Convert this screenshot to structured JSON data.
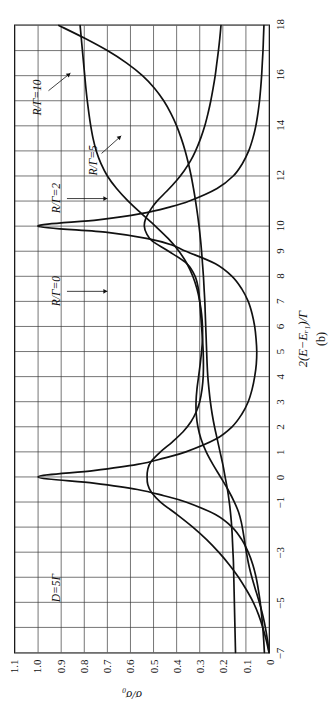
{
  "chart_data": {
    "type": "line",
    "title": "",
    "subtitle": "",
    "panel_caption": "(b)",
    "xlabel": "2(E−Eᵣ₁)/Γ",
    "ylabel": "σ/σ₀",
    "xlim": [
      -7,
      18
    ],
    "ylim": [
      0,
      1.1
    ],
    "grid": true,
    "legend_position": "in-plot-annotations",
    "xticks": [
      -7,
      -5,
      -3,
      -1,
      0,
      1,
      2,
      3,
      4,
      5,
      6,
      7,
      8,
      9,
      10,
      12,
      14,
      16,
      18
    ],
    "xticklabels": [
      "−7",
      "−5",
      "−3",
      "−1",
      "0",
      "1",
      "2",
      "3",
      "4",
      "5",
      "6",
      "7",
      "8",
      "9",
      "10",
      "12",
      "14",
      "16",
      "18"
    ],
    "xgridlines": [
      -7,
      -6,
      -5,
      -4,
      -3,
      -2,
      -1,
      0,
      1,
      2,
      3,
      4,
      5,
      6,
      7,
      8,
      9,
      10,
      11,
      12,
      13,
      14,
      15,
      16,
      17,
      18
    ],
    "yticks": [
      0,
      0.1,
      0.2,
      0.3,
      0.4,
      0.5,
      0.6,
      0.7,
      0.8,
      0.9,
      1.0,
      1.1
    ],
    "yticklabels": [
      "0",
      "0.1",
      "0.2",
      "0.3",
      "0.4",
      "0.5",
      "0.6",
      "0.7",
      "0.8",
      "0.9",
      "1.0",
      "1.1"
    ],
    "annotations": [
      {
        "name": "parameter-note",
        "text": "D=5Γ",
        "x": -4.4,
        "y": 0.92
      },
      {
        "name": "curve-label-r0",
        "text": "R/Γ=0",
        "x": 7.4,
        "y": 0.92
      },
      {
        "name": "curve-label-r2",
        "text": "R/Γ=2",
        "x": 11.1,
        "y": 0.92
      },
      {
        "name": "curve-label-r5",
        "text": "R/Γ=5",
        "x": 12.6,
        "y": 0.76
      },
      {
        "name": "curve-label-r10",
        "text": "R/Γ=10",
        "x": 15.1,
        "y": 1.0
      }
    ],
    "series": [
      {
        "name": "R/Γ=0",
        "label": "R/Γ=0",
        "color": "#111111",
        "x": [
          -7,
          -6.5,
          -6,
          -5.5,
          -5,
          -4.5,
          -4,
          -3.5,
          -3,
          -2.5,
          -2,
          -1.5,
          -1,
          -0.75,
          -0.5,
          -0.25,
          0,
          0.25,
          0.5,
          0.75,
          1,
          1.5,
          2,
          2.5,
          3,
          3.5,
          4,
          4.5,
          5,
          5.5,
          6,
          6.5,
          7,
          7.5,
          8,
          8.5,
          9,
          9.25,
          9.5,
          9.75,
          10,
          10.25,
          10.5,
          10.75,
          11,
          11.5,
          12,
          12.5,
          13,
          13.5,
          14,
          14.5,
          15,
          15.5,
          16,
          16.5,
          17,
          17.5,
          18
        ],
        "y": [
          0.02,
          0.023,
          0.027,
          0.032,
          0.038,
          0.046,
          0.056,
          0.07,
          0.09,
          0.118,
          0.16,
          0.232,
          0.36,
          0.455,
          0.57,
          0.76,
          1.0,
          0.76,
          0.57,
          0.455,
          0.36,
          0.232,
          0.16,
          0.118,
          0.09,
          0.073,
          0.062,
          0.055,
          0.053,
          0.056,
          0.062,
          0.073,
          0.09,
          0.118,
          0.16,
          0.232,
          0.36,
          0.42,
          0.525,
          0.7,
          1.0,
          0.74,
          0.555,
          0.435,
          0.345,
          0.225,
          0.155,
          0.115,
          0.088,
          0.07,
          0.057,
          0.048,
          0.041,
          0.036,
          0.032,
          0.029,
          0.026,
          0.024,
          0.022
        ]
      },
      {
        "name": "R/Γ=2",
        "label": "R/Γ=2",
        "color": "#111111",
        "x": [
          -7,
          -6.5,
          -6,
          -5.5,
          -5,
          -4.5,
          -4,
          -3.5,
          -3,
          -2.5,
          -2,
          -1.5,
          -1,
          -0.6,
          -0.3,
          0,
          0.3,
          0.6,
          1,
          1.4,
          1.8,
          2.2,
          2.6,
          3,
          3.5,
          4,
          4.5,
          5,
          5.5,
          6,
          6.5,
          7,
          7.5,
          8,
          8.5,
          9,
          9.4,
          9.7,
          10,
          10.3,
          10.7,
          11,
          11.4,
          11.8,
          12.2,
          12.6,
          13,
          13.5,
          14,
          14.5,
          15,
          15.5,
          16,
          16.5,
          17,
          17.5,
          18
        ],
        "y": [
          0.0,
          0.012,
          0.027,
          0.045,
          0.068,
          0.098,
          0.132,
          0.172,
          0.218,
          0.27,
          0.33,
          0.398,
          0.47,
          0.51,
          0.525,
          0.528,
          0.525,
          0.512,
          0.47,
          0.418,
          0.372,
          0.338,
          0.315,
          0.3,
          0.29,
          0.285,
          0.284,
          0.285,
          0.288,
          0.292,
          0.296,
          0.3,
          0.306,
          0.32,
          0.355,
          0.435,
          0.505,
          0.53,
          0.54,
          0.534,
          0.51,
          0.485,
          0.442,
          0.402,
          0.368,
          0.34,
          0.318,
          0.296,
          0.278,
          0.264,
          0.252,
          0.242,
          0.233,
          0.226,
          0.219,
          0.213,
          0.208
        ]
      },
      {
        "name": "R/Γ=5",
        "label": "R/Γ=5",
        "color": "#111111",
        "x": [
          -7,
          -6.6,
          -6.2,
          -5.8,
          -5.4,
          -5,
          -4.6,
          -4.2,
          -3.8,
          -3.4,
          -3,
          -2.6,
          -2.2,
          -1.8,
          -1.4,
          -1,
          -0.5,
          0,
          0.5,
          1,
          1.5,
          2,
          2.5,
          3,
          3.5,
          4,
          4.5,
          5,
          5.5,
          6,
          6.5,
          7,
          7.5,
          8,
          8.5,
          9,
          9.5,
          10,
          10.5,
          11,
          11.5,
          12,
          12.5,
          13,
          13.5,
          14,
          14.5,
          15,
          15.5,
          16,
          16.5,
          17,
          17.5,
          18
        ],
        "y": [
          0.0,
          0.005,
          0.012,
          0.02,
          0.03,
          0.042,
          0.055,
          0.068,
          0.08,
          0.09,
          0.098,
          0.105,
          0.112,
          0.12,
          0.132,
          0.15,
          0.178,
          0.21,
          0.243,
          0.272,
          0.294,
          0.308,
          0.315,
          0.316,
          0.312,
          0.305,
          0.298,
          0.292,
          0.288,
          0.288,
          0.292,
          0.3,
          0.312,
          0.33,
          0.355,
          0.39,
          0.436,
          0.492,
          0.552,
          0.61,
          0.66,
          0.7,
          0.728,
          0.748,
          0.762,
          0.772,
          0.78,
          0.787,
          0.793,
          0.798,
          0.803,
          0.808,
          0.813,
          0.818
        ]
      },
      {
        "name": "R/Γ=10",
        "label": "R/Γ=10",
        "color": "#111111",
        "x": [
          -7,
          -6.6,
          -6.2,
          -5.8,
          -5.4,
          -5,
          -4.6,
          -4.2,
          -3.8,
          -3.4,
          -3,
          -2.6,
          -2.2,
          -1.8,
          -1.4,
          -1,
          -0.5,
          0,
          0.5,
          1,
          1.5,
          2,
          2.5,
          3,
          3.5,
          4,
          4.5,
          5,
          5.5,
          6,
          6.5,
          7,
          7.5,
          8,
          8.5,
          9,
          9.5,
          10,
          10.5,
          11,
          11.5,
          12,
          12.5,
          13,
          13.5,
          14,
          14.5,
          15,
          15.5,
          16,
          16.5,
          17,
          17.5,
          18
        ],
        "y": [
          0.145,
          0.146,
          0.147,
          0.148,
          0.149,
          0.15,
          0.151,
          0.152,
          0.153,
          0.154,
          0.156,
          0.158,
          0.16,
          0.163,
          0.167,
          0.172,
          0.18,
          0.19,
          0.2,
          0.212,
          0.224,
          0.236,
          0.246,
          0.254,
          0.26,
          0.265,
          0.268,
          0.27,
          0.272,
          0.274,
          0.276,
          0.278,
          0.281,
          0.284,
          0.288,
          0.292,
          0.297,
          0.303,
          0.31,
          0.318,
          0.327,
          0.337,
          0.349,
          0.363,
          0.38,
          0.4,
          0.425,
          0.456,
          0.496,
          0.548,
          0.616,
          0.7,
          0.8,
          0.91
        ]
      }
    ]
  }
}
